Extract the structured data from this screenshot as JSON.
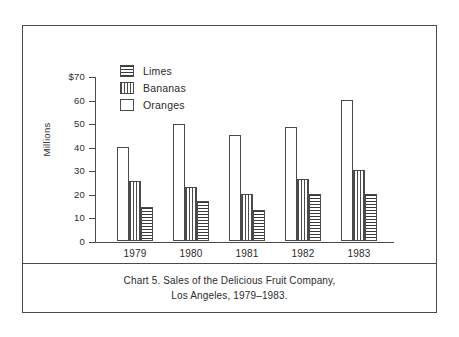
{
  "chart_data": {
    "type": "bar",
    "title": "",
    "categories": [
      "1979",
      "1980",
      "1981",
      "1982",
      "1983"
    ],
    "series": [
      {
        "name": "Oranges",
        "pattern": "empty",
        "values": [
          40,
          49.5,
          45,
          48.5,
          60
        ]
      },
      {
        "name": "Bananas",
        "pattern": "vertical",
        "values": [
          25.5,
          23,
          20,
          26.5,
          30
        ]
      },
      {
        "name": "Limes",
        "pattern": "horizontal",
        "values": [
          14.5,
          17,
          13,
          20,
          20
        ]
      }
    ],
    "xlabel": "",
    "ylabel": "Millions",
    "ylim": [
      0,
      70
    ],
    "ytick_values": [
      70,
      60,
      50,
      40,
      30,
      20,
      10,
      0
    ],
    "ytick_labels": [
      "$70",
      "60",
      "50",
      "40",
      "30",
      "20",
      "10",
      "0"
    ],
    "grid": false,
    "legend_position": "top-left",
    "legend_order": [
      "Limes",
      "Bananas",
      "Oranges"
    ]
  },
  "legend": {
    "items": [
      {
        "label": "Limes",
        "pattern": "horizontal"
      },
      {
        "label": "Bananas",
        "pattern": "vertical"
      },
      {
        "label": "Oranges",
        "pattern": "empty"
      }
    ]
  },
  "axis": {
    "y_title": "Millions",
    "y_labels": [
      "$70",
      "60",
      "50",
      "40",
      "30",
      "20",
      "10",
      "0"
    ],
    "x_labels": [
      "1979",
      "1980",
      "1981",
      "1982",
      "1983"
    ]
  },
  "caption": {
    "line1": "Chart 5.  Sales of the Delicious Fruit Company,",
    "line2": "Los Angeles, 1979–1983."
  },
  "colors": {
    "ink": "#4a4a4a",
    "pattern": "#3a3a3a",
    "background": "#ffffff"
  }
}
